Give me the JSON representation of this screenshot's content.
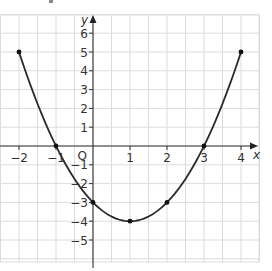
{
  "chart_data": {
    "type": "line",
    "title": "",
    "xlabel": "x",
    "ylabel": "y",
    "origin_label": "O",
    "xlim": [
      -2.5,
      4.5
    ],
    "ylim": [
      -6.2,
      7
    ],
    "grid": true,
    "x_ticks": [
      -2,
      -1,
      1,
      2,
      3,
      4
    ],
    "x_tick_labels": [
      "−2",
      "−1",
      "1",
      "2",
      "3",
      "4"
    ],
    "y_ticks": [
      6,
      5,
      4,
      3,
      2,
      1,
      -1,
      -2,
      -3,
      -4,
      -5
    ],
    "y_tick_labels": [
      "6",
      "5",
      "4",
      "3",
      "2",
      "1",
      "−1",
      "−2",
      "−3",
      "−4",
      "−5"
    ],
    "series": [
      {
        "name": "curve",
        "function": "y = x^2 - 2x - 3",
        "x": [
          -2,
          -1,
          0,
          1,
          2,
          3,
          4
        ],
        "y": [
          5,
          0,
          -3,
          -4,
          -3,
          0,
          5
        ]
      }
    ],
    "color": "#2a2a2a"
  }
}
